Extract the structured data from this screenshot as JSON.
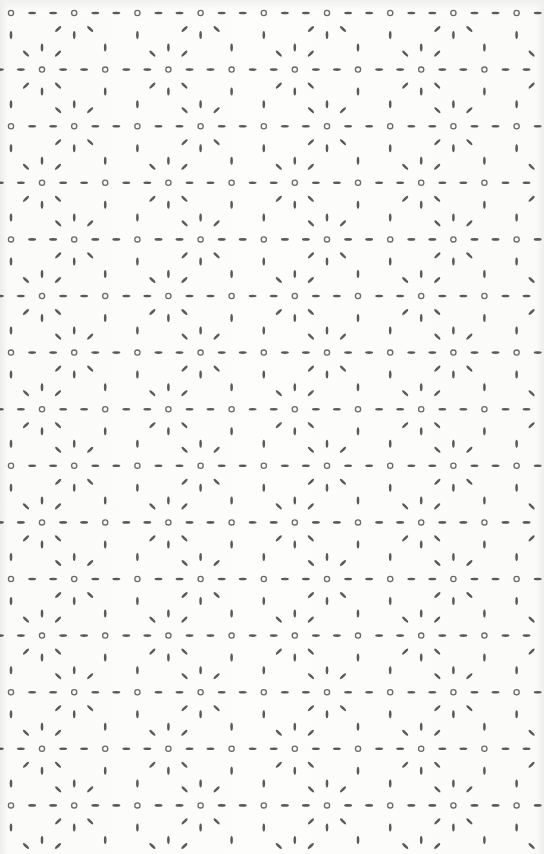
{
  "pattern": {
    "name": "dotted hexagonal star lattice",
    "colors": {
      "background": "#fcfcfb",
      "mark": "#5a5a5a",
      "ring": "#6a6a6a"
    },
    "lattice": {
      "period_x": 63.2,
      "row_spacing": 56.6,
      "first_row_y": 13,
      "even_row_x0": 11,
      "odd_row_x0": 42,
      "rows": 16
    },
    "stars": {
      "period_x": 126.4,
      "even_row_x0": 73.5,
      "odd_row_x0": 40,
      "spoke_offset_axis": 22,
      "spoke_offset_diag": 16
    },
    "marks": {
      "dash_length": 8,
      "dash_thickness": 2.6,
      "ring_radius": 2.6,
      "ring_stroke": 1.3
    }
  }
}
